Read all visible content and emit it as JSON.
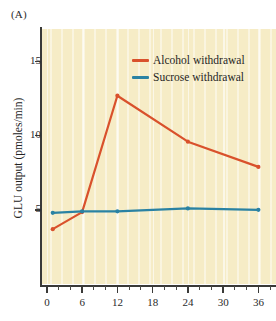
{
  "figure": {
    "panel_label": "(A)",
    "background_color": "#f6ecc6",
    "axis_color": "#3a3a38"
  },
  "chart_data": {
    "type": "line",
    "title": "",
    "xlabel": "",
    "ylabel": "GLU output (pmoles/min)",
    "xlim": [
      -1,
      39
    ],
    "ylim": [
      0,
      17.2
    ],
    "grid": false,
    "grid_style": "vertical cream stripes",
    "legend_position": "upper right inside",
    "y_ticks": [
      5,
      10,
      15
    ],
    "y_tick_labels": [
      "5",
      "10",
      "15"
    ],
    "x_ticks": [
      0,
      6,
      12,
      18,
      24,
      30,
      36
    ],
    "x_tick_labels": [
      "0",
      "6",
      "12",
      "18",
      "24",
      "30",
      "36"
    ],
    "x_minor_ticks": [
      2,
      4,
      8,
      10,
      14,
      16,
      20,
      22,
      26,
      28,
      32,
      34,
      38
    ],
    "series": [
      {
        "name": "Alcohol withdrawal",
        "color": "#d9512c",
        "marker": "circle",
        "x": [
          1,
          6,
          12,
          24,
          36
        ],
        "values": [
          3.7,
          4.85,
          12.7,
          9.6,
          7.9
        ]
      },
      {
        "name": "Sucrose withdrawal",
        "color": "#2a82a3",
        "marker": "circle",
        "x": [
          1,
          6,
          12,
          24,
          36
        ],
        "values": [
          4.8,
          4.9,
          4.9,
          5.1,
          5.0
        ]
      }
    ]
  },
  "legend": {
    "items": [
      {
        "label": "Alcohol withdrawal",
        "color": "#d9512c"
      },
      {
        "label": "Sucrose withdrawal",
        "color": "#2a82a3"
      }
    ]
  }
}
